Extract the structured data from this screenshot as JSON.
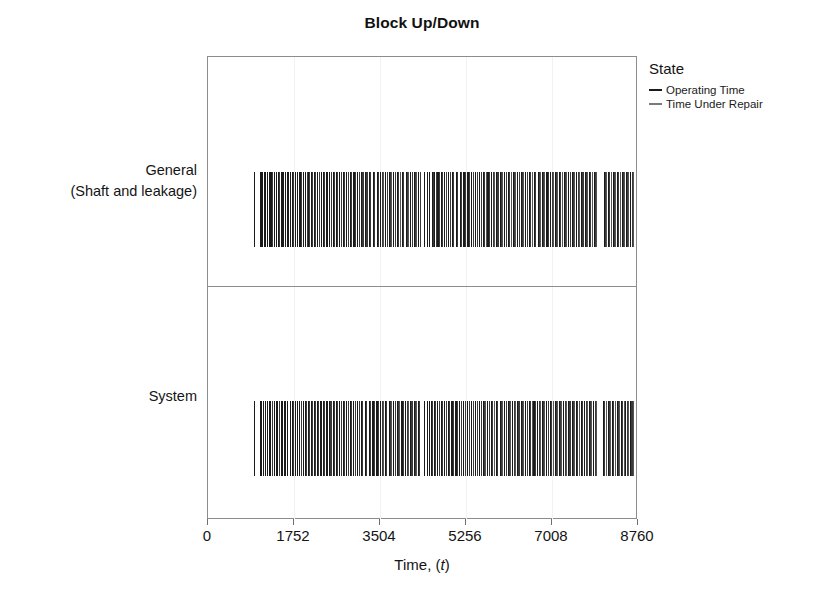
{
  "chart_data": {
    "type": "bar",
    "title": "Block Up/Down",
    "xlabel": "Time, (t)",
    "ylabel": "",
    "xlim": [
      0,
      8760
    ],
    "xticks": [
      0,
      1752,
      3504,
      5256,
      7008,
      8760
    ],
    "xtick_labels": [
      "0",
      "1752",
      "3504",
      "5256",
      "7008",
      "8760"
    ],
    "grid": true,
    "legend_position": "right",
    "legend_title": "State",
    "legend_entries": [
      {
        "name": "Operating Time",
        "color": "#1a1a1a"
      },
      {
        "name": "Time Under Repair",
        "color": "#7a7a7a"
      }
    ],
    "categories": [
      "General\n(Shaft and leakage)",
      "System"
    ],
    "series": [
      {
        "name": "General (Shaft and leakage)",
        "label_lines": [
          "General",
          "(Shaft and leakage)"
        ],
        "data_start": 940,
        "data_end": 8700,
        "segments": [
          [
            940,
            952
          ],
          [
            1060,
            1072
          ],
          [
            1088,
            1120
          ],
          [
            1134,
            1148
          ],
          [
            1162,
            1196
          ],
          [
            1210,
            1232
          ],
          [
            1246,
            1258
          ],
          [
            1272,
            1336
          ],
          [
            1350,
            1366
          ],
          [
            1380,
            1402
          ],
          [
            1416,
            1470
          ],
          [
            1484,
            1500
          ],
          [
            1514,
            1548
          ],
          [
            1562,
            1600
          ],
          [
            1614,
            1652
          ],
          [
            1666,
            1700
          ],
          [
            1714,
            1760
          ],
          [
            1774,
            1800
          ],
          [
            1814,
            1848
          ],
          [
            1862,
            1930
          ],
          [
            1944,
            1970
          ],
          [
            1984,
            2030
          ],
          [
            2044,
            2090
          ],
          [
            2104,
            2150
          ],
          [
            2164,
            2210
          ],
          [
            2224,
            2280
          ],
          [
            2294,
            2330
          ],
          [
            2344,
            2400
          ],
          [
            2414,
            2450
          ],
          [
            2464,
            2530
          ],
          [
            2544,
            2600
          ],
          [
            2614,
            2660
          ],
          [
            2674,
            2740
          ],
          [
            2754,
            2800
          ],
          [
            2814,
            2880
          ],
          [
            2894,
            2950
          ],
          [
            2964,
            3030
          ],
          [
            3044,
            3100
          ],
          [
            3114,
            3180
          ],
          [
            3194,
            3260
          ],
          [
            3274,
            3340
          ],
          [
            3354,
            3420
          ],
          [
            3434,
            3500
          ],
          [
            3514,
            3590
          ],
          [
            3604,
            3670
          ],
          [
            3684,
            3760
          ],
          [
            3774,
            3840
          ],
          [
            3854,
            3930
          ],
          [
            3944,
            4010
          ],
          [
            4024,
            4100
          ],
          [
            4114,
            4180
          ],
          [
            4194,
            4270
          ],
          [
            4284,
            4340
          ],
          [
            4400,
            4412
          ],
          [
            4470,
            4490
          ],
          [
            4504,
            4540
          ],
          [
            4554,
            4600
          ],
          [
            4614,
            4660
          ],
          [
            4674,
            4740
          ],
          [
            4754,
            4800
          ],
          [
            4814,
            4880
          ],
          [
            4894,
            4950
          ],
          [
            4964,
            5030
          ],
          [
            5044,
            5110
          ],
          [
            5124,
            5190
          ],
          [
            5204,
            5270
          ],
          [
            5284,
            5350
          ],
          [
            5364,
            5430
          ],
          [
            5444,
            5510
          ],
          [
            5524,
            5590
          ],
          [
            5604,
            5680
          ],
          [
            5694,
            5760
          ],
          [
            5774,
            5850
          ],
          [
            5864,
            5930
          ],
          [
            5944,
            6020
          ],
          [
            6034,
            6100
          ],
          [
            6114,
            6190
          ],
          [
            6204,
            6280
          ],
          [
            6294,
            6360
          ],
          [
            6374,
            6450
          ],
          [
            6464,
            6530
          ],
          [
            6544,
            6620
          ],
          [
            6634,
            6700
          ],
          [
            6714,
            6790
          ],
          [
            6804,
            6880
          ],
          [
            6894,
            6960
          ],
          [
            6974,
            7050
          ],
          [
            7064,
            7140
          ],
          [
            7154,
            7230
          ],
          [
            7244,
            7320
          ],
          [
            7334,
            7400
          ],
          [
            7414,
            7490
          ],
          [
            7504,
            7580
          ],
          [
            7594,
            7660
          ],
          [
            7674,
            7750
          ],
          [
            7764,
            7840
          ],
          [
            7854,
            7930
          ],
          [
            8060,
            8140
          ],
          [
            8154,
            8230
          ],
          [
            8244,
            8320
          ],
          [
            8334,
            8410
          ],
          [
            8424,
            8500
          ],
          [
            8514,
            8590
          ],
          [
            8604,
            8680
          ]
        ]
      },
      {
        "name": "System",
        "label_lines": [
          "System"
        ],
        "data_start": 940,
        "data_end": 8700,
        "segments": [
          [
            940,
            952
          ],
          [
            1050,
            1064
          ],
          [
            1082,
            1116
          ],
          [
            1130,
            1146
          ],
          [
            1160,
            1194
          ],
          [
            1208,
            1228
          ],
          [
            1242,
            1256
          ],
          [
            1270,
            1330
          ],
          [
            1344,
            1362
          ],
          [
            1376,
            1400
          ],
          [
            1414,
            1466
          ],
          [
            1480,
            1498
          ],
          [
            1512,
            1544
          ],
          [
            1558,
            1596
          ],
          [
            1610,
            1648
          ],
          [
            1662,
            1696
          ],
          [
            1710,
            1756
          ],
          [
            1770,
            1798
          ],
          [
            1812,
            1846
          ],
          [
            1860,
            1926
          ],
          [
            1940,
            1966
          ],
          [
            1980,
            2026
          ],
          [
            2040,
            2086
          ],
          [
            2100,
            2146
          ],
          [
            2160,
            2206
          ],
          [
            2220,
            2276
          ],
          [
            2290,
            2326
          ],
          [
            2340,
            2396
          ],
          [
            2410,
            2446
          ],
          [
            2460,
            2526
          ],
          [
            2540,
            2596
          ],
          [
            2610,
            2656
          ],
          [
            2670,
            2736
          ],
          [
            2750,
            2796
          ],
          [
            2810,
            2876
          ],
          [
            2890,
            2946
          ],
          [
            2960,
            3026
          ],
          [
            3040,
            3096
          ],
          [
            3110,
            3176
          ],
          [
            3190,
            3256
          ],
          [
            3270,
            3336
          ],
          [
            3350,
            3416
          ],
          [
            3430,
            3496
          ],
          [
            3510,
            3586
          ],
          [
            3600,
            3666
          ],
          [
            3680,
            3756
          ],
          [
            3770,
            3836
          ],
          [
            3850,
            3926
          ],
          [
            3940,
            4006
          ],
          [
            4020,
            4096
          ],
          [
            4110,
            4176
          ],
          [
            4190,
            4266
          ],
          [
            4280,
            4336
          ],
          [
            4396,
            4408
          ],
          [
            4466,
            4486
          ],
          [
            4500,
            4536
          ],
          [
            4550,
            4596
          ],
          [
            4610,
            4656
          ],
          [
            4670,
            4736
          ],
          [
            4750,
            4796
          ],
          [
            4810,
            4876
          ],
          [
            4890,
            4946
          ],
          [
            4960,
            5026
          ],
          [
            5040,
            5106
          ],
          [
            5120,
            5186
          ],
          [
            5200,
            5266
          ],
          [
            5280,
            5346
          ],
          [
            5360,
            5426
          ],
          [
            5440,
            5506
          ],
          [
            5520,
            5586
          ],
          [
            5600,
            5676
          ],
          [
            5690,
            5756
          ],
          [
            5770,
            5846
          ],
          [
            5860,
            5926
          ],
          [
            5940,
            6016
          ],
          [
            6030,
            6096
          ],
          [
            6110,
            6186
          ],
          [
            6200,
            6276
          ],
          [
            6290,
            6356
          ],
          [
            6370,
            6446
          ],
          [
            6460,
            6526
          ],
          [
            6540,
            6616
          ],
          [
            6630,
            6696
          ],
          [
            6710,
            6786
          ],
          [
            6800,
            6876
          ],
          [
            6890,
            6956
          ],
          [
            6970,
            7046
          ],
          [
            7060,
            7136
          ],
          [
            7150,
            7226
          ],
          [
            7240,
            7316
          ],
          [
            7330,
            7396
          ],
          [
            7410,
            7486
          ],
          [
            7500,
            7576
          ],
          [
            7590,
            7656
          ],
          [
            7670,
            7746
          ],
          [
            7760,
            7836
          ],
          [
            7850,
            7926
          ],
          [
            8050,
            8130
          ],
          [
            8144,
            8220
          ],
          [
            8234,
            8310
          ],
          [
            8324,
            8400
          ],
          [
            8414,
            8490
          ],
          [
            8504,
            8580
          ],
          [
            8594,
            8690
          ]
        ]
      }
    ]
  }
}
